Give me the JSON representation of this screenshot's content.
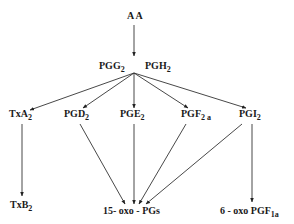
{
  "diagram": {
    "nodes": {
      "aa": {
        "label": "A A"
      },
      "pgg2": {
        "label": "PGG",
        "sub": "2"
      },
      "pgh2": {
        "label": "PGH",
        "sub": "2"
      },
      "txa2": {
        "label": "TxA",
        "sub": "2"
      },
      "pgd2": {
        "label": "PGD",
        "sub": "2"
      },
      "pge2": {
        "label": "PGE",
        "sub": "2"
      },
      "pgf2a": {
        "label": "PGF",
        "sub": "2 a"
      },
      "pgi2": {
        "label": "PGI",
        "sub": "2"
      },
      "txb2": {
        "label": "TxB",
        "sub": "2"
      },
      "oxo15": {
        "label": "15- oxo - PGs"
      },
      "oxo6": {
        "label": "6 - oxo PGF",
        "sub": "1a"
      }
    },
    "edges": [
      {
        "from": "A A",
        "to": "PGG2/PGH2"
      },
      {
        "from": "PGG2/PGH2",
        "to": "TxA2"
      },
      {
        "from": "PGG2/PGH2",
        "to": "PGD2"
      },
      {
        "from": "PGG2/PGH2",
        "to": "PGE2"
      },
      {
        "from": "PGG2/PGH2",
        "to": "PGF2a"
      },
      {
        "from": "PGG2/PGH2",
        "to": "PGI2"
      },
      {
        "from": "TxA2",
        "to": "TxB2"
      },
      {
        "from": "PGD2",
        "to": "15- oxo - PGs"
      },
      {
        "from": "PGE2",
        "to": "15- oxo - PGs"
      },
      {
        "from": "PGF2a",
        "to": "15- oxo - PGs"
      },
      {
        "from": "PGI2",
        "to": "15- oxo - PGs"
      },
      {
        "from": "PGI2",
        "to": "6 - oxo PGF1a"
      }
    ]
  }
}
